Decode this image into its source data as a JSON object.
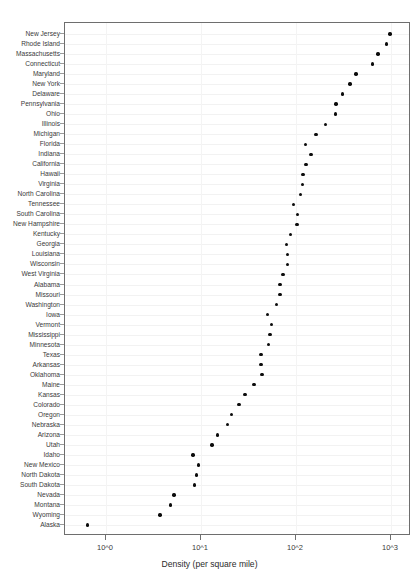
{
  "chart_data": {
    "type": "scatter",
    "title": "",
    "xlabel": "Density (per square mile)",
    "ylabel": "",
    "xscale": "log",
    "xlim": [
      0.55,
      1400
    ],
    "grid": true,
    "legend": "none",
    "xtick_labels": [
      "10^0",
      "10^1",
      "10^2",
      "10^3"
    ],
    "xtick_values": [
      1,
      10,
      100,
      1000
    ],
    "categories": [
      "New Jersey",
      "Rhode Island",
      "Massachusetts",
      "Connecticut",
      "Maryland",
      "New York",
      "Delaware",
      "Pennsylvania",
      "Ohio",
      "Illinois",
      "Michigan",
      "Florida",
      "Indiana",
      "California",
      "Hawaii",
      "Virginia",
      "North Carolina",
      "Tennessee",
      "South Carolina",
      "New Hampshire",
      "Kentucky",
      "Georgia",
      "Louisiana",
      "Wisconsin",
      "West Virginia",
      "Alabama",
      "Missouri",
      "Washington",
      "Iowa",
      "Vermont",
      "Mississippi",
      "Minnesota",
      "Texas",
      "Arkansas",
      "Oklahoma",
      "Maine",
      "Kansas",
      "Colorado",
      "Oregon",
      "Nebraska",
      "Arizona",
      "Utah",
      "Idaho",
      "New Mexico",
      "North Dakota",
      "South Dakota",
      "Nevada",
      "Montana",
      "Wyoming",
      "Alaska"
    ],
    "values": [
      975,
      903,
      733,
      638,
      429,
      371,
      308,
      264,
      260,
      205,
      162,
      126,
      144,
      128,
      119,
      117,
      111,
      94,
      103,
      102,
      87,
      79,
      81,
      81,
      73,
      68,
      68,
      62,
      50,
      55,
      53,
      51,
      43,
      43,
      44,
      36,
      29,
      25,
      21,
      19,
      15,
      13,
      8.2,
      9.4,
      8.9,
      8.6,
      5.2,
      4.8,
      3.7,
      0.64
    ]
  },
  "axis": {
    "x_title": "Density (per square mile)",
    "tick_0": "10^0",
    "tick_1": "10^1",
    "tick_2": "10^2",
    "tick_3": "10^3"
  }
}
